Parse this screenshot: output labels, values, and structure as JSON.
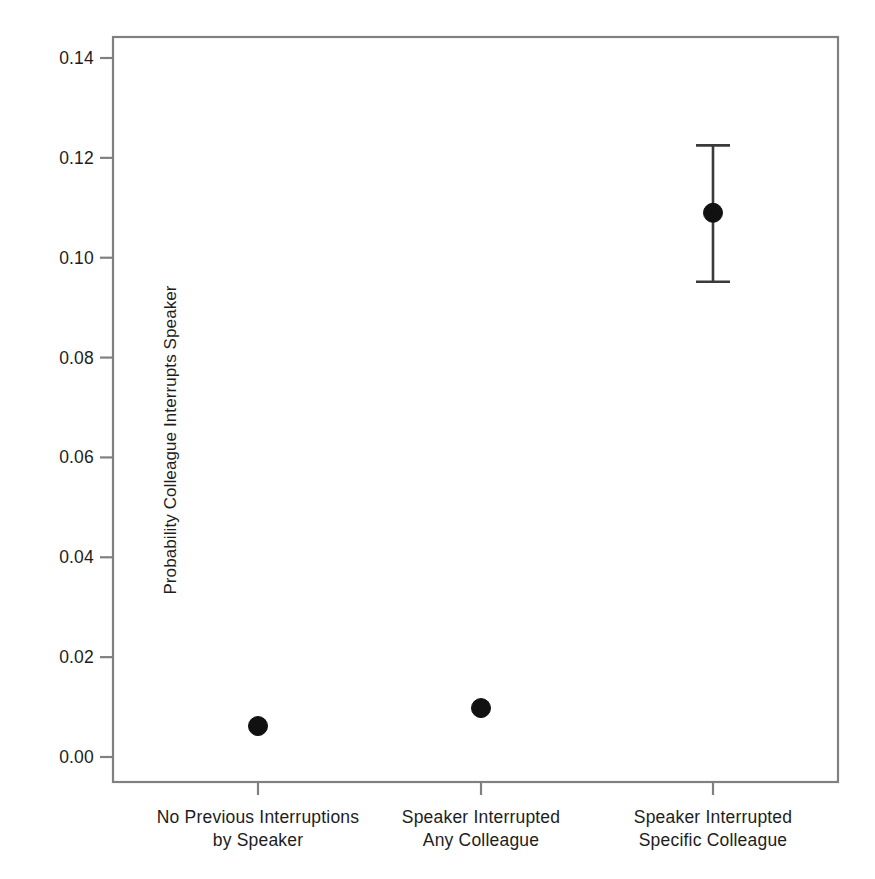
{
  "chart_data": {
    "type": "scatter",
    "title": "",
    "xlabel": "",
    "ylabel": "Probability Colleague Interrupts Speaker",
    "categories": [
      "No Previous Interruptions\nby Speaker",
      "Speaker Interrupted\nAny Colleague",
      "Speaker Interrupted\nSpecific Colleague"
    ],
    "category_lines": [
      [
        "No Previous Interruptions",
        "by Speaker"
      ],
      [
        "Speaker Interrupted",
        "Any Colleague"
      ],
      [
        "Speaker Interrupted",
        "Specific Colleague"
      ]
    ],
    "values": [
      0.0062,
      0.0098,
      0.109
    ],
    "errors_low": [
      null,
      null,
      0.0952
    ],
    "errors_high": [
      null,
      null,
      0.1225
    ],
    "ylim": [
      -0.0025,
      0.1455
    ],
    "yticks": [
      0.0,
      0.02,
      0.04,
      0.06,
      0.08,
      0.1,
      0.12,
      0.14
    ],
    "ytick_labels": [
      "0.00",
      "0.02",
      "0.04",
      "0.06",
      "0.08",
      "0.10",
      "0.12",
      "0.14"
    ],
    "grid": false,
    "legend": null,
    "marker": "filled-circle",
    "marker_color": "#111111",
    "errorbar_color": "#3a3a3a",
    "frame_color": "#808080",
    "background": "#ffffff"
  },
  "axes": {
    "y_title": "Probability Colleague Interrupts Speaker"
  }
}
